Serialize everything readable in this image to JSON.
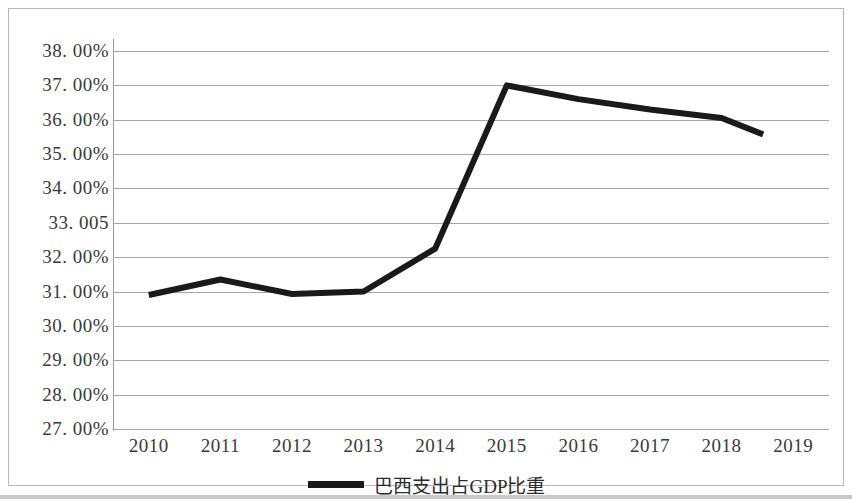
{
  "chart_data": {
    "type": "line",
    "title": "",
    "xlabel": "",
    "ylabel": "",
    "categories": [
      "2010",
      "2011",
      "2012",
      "2013",
      "2014",
      "2015",
      "2016",
      "2017",
      "2018",
      "2019"
    ],
    "series": [
      {
        "name": "巴西支出占GDP比重",
        "values": [
          30.9,
          31.35,
          30.93,
          31.0,
          32.25,
          37.0,
          36.6,
          36.3,
          36.05,
          35.57
        ],
        "color": "#1a1a1a"
      }
    ],
    "ylim": [
      27.0,
      38.0
    ],
    "ytick_labels": [
      "38. 00%",
      "37. 00%",
      "36. 00%",
      "35. 00%",
      "34. 00%",
      "33. 005",
      "32. 00%",
      "31. 00%",
      "30. 00%",
      "29. 00%",
      "28. 00%",
      "27. 00%"
    ],
    "ytick_values": [
      38,
      37,
      36,
      35,
      34,
      33,
      32,
      31,
      30,
      29,
      28,
      27
    ],
    "grid": true,
    "gridline_color": "#a6a6a6",
    "legend_position": "bottom",
    "last_point_truncated": true
  },
  "legend": {
    "label": "巴西支出占GDP比重"
  }
}
